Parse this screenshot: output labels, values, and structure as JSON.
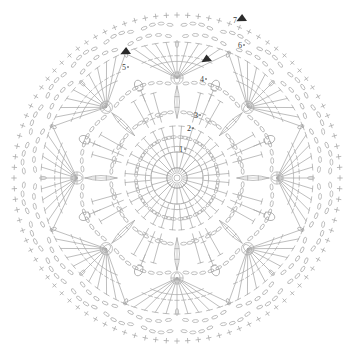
{
  "document": {
    "type": "crochet-pattern-chart",
    "title": "",
    "shape": "circular-mandala-doily",
    "symmetry_fold": 8,
    "background_color": "#ffffff",
    "stitch_line_color": "#a8a8a8",
    "marker_color": "#2b2b2b",
    "label_color": "#3a3a3a",
    "canvas": {
      "width": 354,
      "height": 355
    },
    "center": {
      "x": 177,
      "y": 178
    }
  },
  "round_labels": [
    {
      "text": "1",
      "x": 181,
      "y": 152
    },
    {
      "text": "2",
      "x": 189,
      "y": 131
    },
    {
      "text": "3",
      "x": 196,
      "y": 118
    },
    {
      "text": "4",
      "x": 202,
      "y": 82
    },
    {
      "text": "5",
      "x": 124,
      "y": 70
    },
    {
      "text": "6",
      "x": 240,
      "y": 48
    },
    {
      "text": "7",
      "x": 235,
      "y": 23
    }
  ],
  "markers": [
    {
      "name": "start-arrow-round-7",
      "x": 247,
      "y": 21,
      "rotation": 200
    },
    {
      "name": "start-arrow-round-6",
      "x": 212,
      "y": 61,
      "rotation": 195
    },
    {
      "name": "start-arrow-round-5",
      "x": 131,
      "y": 54,
      "rotation": 200
    }
  ],
  "chart_data": {
    "type": "radial-stitch-diagram",
    "rings": [
      {
        "round": 1,
        "radius": 8,
        "stitch": "magic-ring",
        "count": 1,
        "note": "center ring"
      },
      {
        "round": 1,
        "radius": 26,
        "stitch": "double-crochet",
        "count": 24,
        "note": "stitches into ring"
      },
      {
        "round": 2,
        "radius": 40,
        "stitch": "chain-loop",
        "count": 16,
        "note": "chain arc ring"
      },
      {
        "round": 2,
        "radius": 52,
        "stitch": "double-crochet-vstitch",
        "count": 16,
        "note": "v-stitch ring"
      },
      {
        "round": 3,
        "radius": 66,
        "stitch": "chain-and-treble",
        "count": 16,
        "note": "mesh ring"
      },
      {
        "round": 3,
        "radius": 80,
        "stitch": "petal-leaf-cluster",
        "count": 8,
        "note": "leaf motifs"
      },
      {
        "round": 4,
        "radius": 94,
        "stitch": "chain-arc",
        "count": 8,
        "note": "octagon chain frame"
      },
      {
        "round": 4,
        "radius": 100,
        "stitch": "puff-bobble",
        "count": 8,
        "note": "bobble at arc midpoint"
      },
      {
        "round": 5,
        "radius": 110,
        "stitch": "treble-fan-cluster",
        "count": 8,
        "note": "fan of 11 trebles"
      },
      {
        "round": 5,
        "radius": 108,
        "stitch": "circled-bobble",
        "count": 8,
        "note": "fan apex bobble"
      },
      {
        "round": 6,
        "radius": 140,
        "stitch": "chain-arc",
        "count": 16,
        "note": "scallop chain ring"
      },
      {
        "round": 7,
        "radius": 160,
        "stitch": "single-crochet",
        "count": 96,
        "note": "picot edging crosses"
      },
      {
        "round": 7,
        "radius": 150,
        "stitch": "chain-scallop",
        "count": 24,
        "note": "outer chain scallops"
      }
    ],
    "legend": [
      {
        "symbol": "+",
        "name": "single-crochet"
      },
      {
        "symbol": "oval",
        "name": "chain-stitch"
      },
      {
        "symbol": "T",
        "name": "double-crochet"
      },
      {
        "symbol": "T-bar",
        "name": "treble-crochet"
      },
      {
        "symbol": "filled-oval-bar",
        "name": "puff-stitch"
      },
      {
        "symbol": "circled-oval",
        "name": "bobble-stitch"
      },
      {
        "symbol": "triangle",
        "name": "round-start-marker"
      }
    ],
    "title": "",
    "xlabel": "",
    "ylabel": ""
  }
}
